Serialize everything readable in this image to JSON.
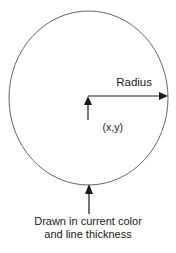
{
  "figure": {
    "shape": {
      "name": "circle",
      "stroke_color": "#555555",
      "fill": "none"
    },
    "labels": {
      "radius": "Radius",
      "center": "(x,y)",
      "caption_line_1": "Drawn in current color",
      "caption_line_2": "and line thickness"
    },
    "annotations": {
      "radius_arrow": "arrow pointing right from center to circle edge",
      "center_arrow": "arrow pointing up to center point",
      "outline_arrow": "arrow pointing up to circle outline"
    },
    "colors": {
      "background": "#ffffff",
      "ink": "#1a1a1a",
      "outline": "#555555"
    }
  }
}
